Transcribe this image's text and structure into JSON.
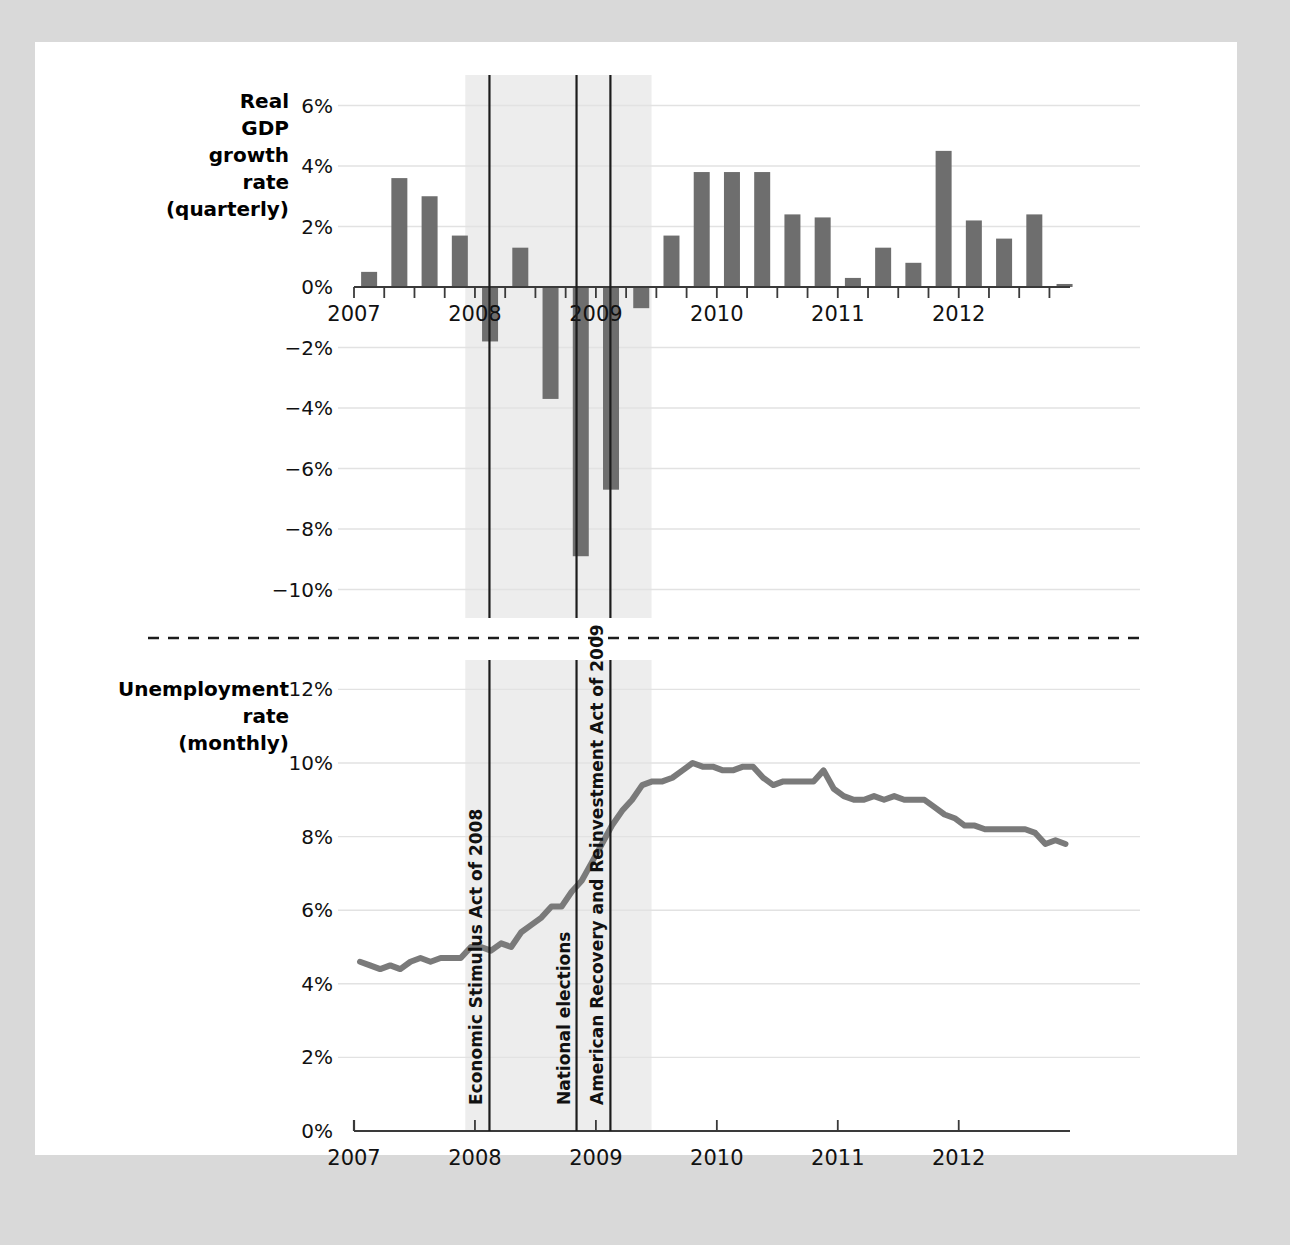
{
  "page": {
    "background_color": "#d9d9d9",
    "paper_color": "#ffffff"
  },
  "colors": {
    "bar": "#6e6e6e",
    "line": "#7a7a7a",
    "grid": "#e2e2e2",
    "axis": "#3a3a3a",
    "recession_band": "#ededed",
    "event_line": "#1c1c1c",
    "divider": "#1c1c1c"
  },
  "panels": {
    "gdp": {
      "title_lines": [
        "Real",
        "GDP",
        "growth",
        "rate",
        "(quarterly)"
      ],
      "y_ticks": [
        "6%",
        "4%",
        "2%",
        "0%",
        "−2%",
        "−4%",
        "−6%",
        "−8%",
        "−10%"
      ],
      "x_ticks": [
        "2007",
        "2008",
        "2009",
        "2010",
        "2011",
        "2012"
      ]
    },
    "unemployment": {
      "title_lines": [
        "Unemployment",
        "rate",
        "(monthly)"
      ],
      "y_ticks": [
        "12%",
        "10%",
        "8%",
        "6%",
        "4%",
        "2%",
        "0%"
      ],
      "x_ticks": [
        "2007",
        "2008",
        "2009",
        "2010",
        "2011",
        "2012"
      ]
    }
  },
  "annotations": [
    {
      "label": "Economic Stimulus Act of 2008",
      "x_year": 2008.12
    },
    {
      "label": "National elections",
      "x_year": 2008.84
    },
    {
      "label": "American Recovery and Reinvestment Act of 2009",
      "x_year": 2009.12
    }
  ],
  "recession": {
    "start_year": 2007.92,
    "end_year": 2009.46
  },
  "chart_data": [
    {
      "type": "bar",
      "title": "Real GDP growth rate (quarterly)",
      "xlabel": "",
      "ylabel": "Real GDP growth rate (quarterly)",
      "ylim": [
        -10,
        6
      ],
      "xlim": [
        2007.0,
        2012.92
      ],
      "grid": true,
      "legend": "none",
      "categories": [
        "2007Q1",
        "2007Q2",
        "2007Q3",
        "2007Q4",
        "2008Q1",
        "2008Q2",
        "2008Q3",
        "2008Q4",
        "2009Q1",
        "2009Q2",
        "2009Q3",
        "2009Q4",
        "2010Q1",
        "2010Q2",
        "2010Q3",
        "2010Q4",
        "2011Q1",
        "2011Q2",
        "2011Q3",
        "2011Q4",
        "2012Q1",
        "2012Q2",
        "2012Q3",
        "2012Q4"
      ],
      "x": [
        2007.0,
        2007.25,
        2007.5,
        2007.75,
        2008.0,
        2008.25,
        2008.5,
        2008.75,
        2009.0,
        2009.25,
        2009.5,
        2009.75,
        2010.0,
        2010.25,
        2010.5,
        2010.75,
        2011.0,
        2011.25,
        2011.5,
        2011.75,
        2012.0,
        2012.25,
        2012.5,
        2012.75
      ],
      "values": [
        0.5,
        3.6,
        3.0,
        1.7,
        -1.8,
        1.3,
        -3.7,
        -8.9,
        -6.7,
        -0.7,
        1.7,
        3.8,
        3.8,
        3.8,
        2.4,
        2.3,
        0.3,
        1.3,
        0.8,
        4.5,
        2.2,
        1.6,
        2.4,
        0.1
      ]
    },
    {
      "type": "line",
      "title": "Unemployment rate (monthly)",
      "xlabel": "",
      "ylabel": "Unemployment rate (monthly)",
      "ylim": [
        0,
        12.6
      ],
      "xlim": [
        2007.0,
        2012.92
      ],
      "grid": true,
      "legend": "none",
      "x": [
        2007.0,
        2007.083,
        2007.167,
        2007.25,
        2007.333,
        2007.417,
        2007.5,
        2007.583,
        2007.667,
        2007.75,
        2007.833,
        2007.917,
        2008.0,
        2008.083,
        2008.167,
        2008.25,
        2008.333,
        2008.417,
        2008.5,
        2008.583,
        2008.667,
        2008.75,
        2008.833,
        2008.917,
        2009.0,
        2009.083,
        2009.167,
        2009.25,
        2009.333,
        2009.417,
        2009.5,
        2009.583,
        2009.667,
        2009.75,
        2009.833,
        2009.917,
        2010.0,
        2010.083,
        2010.167,
        2010.25,
        2010.333,
        2010.417,
        2010.5,
        2010.583,
        2010.667,
        2010.75,
        2010.833,
        2010.917,
        2011.0,
        2011.083,
        2011.167,
        2011.25,
        2011.333,
        2011.417,
        2011.5,
        2011.583,
        2011.667,
        2011.75,
        2011.833,
        2011.917,
        2012.0,
        2012.083,
        2012.167,
        2012.25,
        2012.333,
        2012.417,
        2012.5,
        2012.583,
        2012.667,
        2012.75,
        2012.833
      ],
      "values": [
        4.6,
        4.5,
        4.4,
        4.5,
        4.4,
        4.6,
        4.7,
        4.6,
        4.7,
        4.7,
        4.7,
        5.0,
        5.0,
        4.9,
        5.1,
        5.0,
        5.4,
        5.6,
        5.8,
        6.1,
        6.1,
        6.5,
        6.8,
        7.3,
        7.8,
        8.3,
        8.7,
        9.0,
        9.4,
        9.5,
        9.5,
        9.6,
        9.8,
        10.0,
        9.9,
        9.9,
        9.8,
        9.8,
        9.9,
        9.9,
        9.6,
        9.4,
        9.5,
        9.5,
        9.5,
        9.5,
        9.8,
        9.3,
        9.1,
        9.0,
        9.0,
        9.1,
        9.0,
        9.1,
        9.0,
        9.0,
        9.0,
        8.8,
        8.6,
        8.5,
        8.3,
        8.3,
        8.2,
        8.2,
        8.2,
        8.2,
        8.2,
        8.1,
        7.8,
        7.9,
        7.8
      ]
    }
  ]
}
